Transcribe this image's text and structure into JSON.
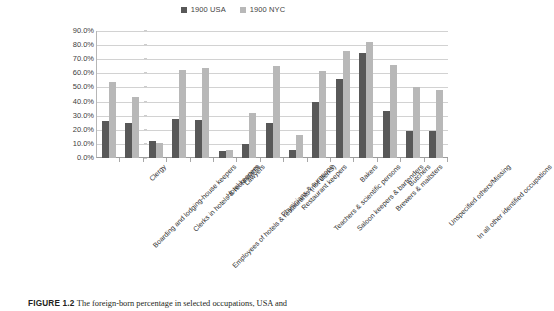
{
  "legend": {
    "items": [
      {
        "label": "1900 USA",
        "color": "#585858",
        "name": "legend-item-usa"
      },
      {
        "label": "1900 NYC",
        "color": "#b8b8b8",
        "name": "legend-item-nyc"
      }
    ]
  },
  "caption": {
    "figure_number": "FIGURE 1.2",
    "text": "The foreign-born percentage in selected occupations, USA and"
  },
  "chart_data": {
    "type": "bar",
    "title": "",
    "xlabel": "",
    "ylabel": "",
    "ylim": [
      0,
      90
    ],
    "ytick_labels": [
      "0.0%",
      "10.0%",
      "20.0%",
      "30.0%",
      "40.0%",
      "50.0%",
      "60.0%",
      "70.0%",
      "80.0%",
      "90.0%"
    ],
    "ytick_values": [
      0,
      10,
      20,
      30,
      40,
      50,
      60,
      70,
      80,
      90
    ],
    "grid": true,
    "legend_position": "top-center",
    "categories": [
      "Boarding and lodging-house keepers",
      "Clergy",
      "Clerks in hotels & restaurants",
      "Employees of hotels & restaurants (not clerks)",
      "Hotel keepers",
      "Lawyers",
      "Physicians & surgeons",
      "Restaurant keepers",
      "Teachers & scientific persons",
      "Saloon keepers & bartenders",
      "Bakers",
      "Brewers & maltsters",
      "Butchers",
      "Unspecified others/Missing",
      "In all other identified occupations"
    ],
    "series": [
      {
        "name": "1900 USA",
        "color": "#585858",
        "values": [
          26.5,
          25.0,
          12.0,
          28.0,
          27.0,
          4.7,
          10.0,
          24.5,
          6.0,
          39.5,
          56.0,
          74.5,
          33.5,
          19.0,
          19.0
        ]
      },
      {
        "name": "1900 NYC",
        "color": "#b8b8b8",
        "values": [
          54.0,
          43.0,
          10.8,
          62.5,
          63.5,
          6.0,
          32.0,
          65.5,
          16.0,
          61.5,
          75.5,
          82.5,
          66.0,
          50.0,
          48.5
        ]
      }
    ]
  }
}
